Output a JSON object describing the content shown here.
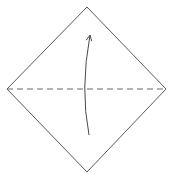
{
  "diagram": {
    "type": "origami-fold-step",
    "colors": {
      "background": "#ffffff",
      "outline": "#5a5a5a",
      "fold_line": "#6a6a6a",
      "arrow": "#4a4a4a"
    },
    "paper": {
      "shape": "diamond",
      "vertices": {
        "top": [
          87,
          7
        ],
        "right": [
          166,
          89
        ],
        "bottom": [
          87,
          172
        ],
        "left": [
          7,
          89
        ]
      }
    },
    "fold_line": {
      "style": "dashed",
      "meaning": "valley-fold",
      "from": [
        7,
        89
      ],
      "to": [
        166,
        89
      ],
      "dash": "6 4"
    },
    "arrow": {
      "direction": "up",
      "meaning": "fold bottom half up",
      "start": [
        89,
        135
      ],
      "control": [
        80,
        89
      ],
      "end": [
        90,
        35
      ],
      "head": "open"
    }
  }
}
